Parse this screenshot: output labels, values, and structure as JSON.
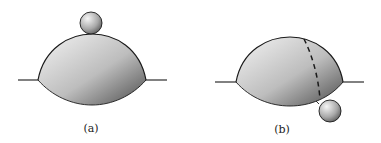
{
  "panels": [
    {
      "id": "a",
      "label": "(a)",
      "description": "Small sphere resting on top of a lens-shaped drop at an interface"
    },
    {
      "id": "b",
      "label": "(b)",
      "description": "Lens-shaped drop with dashed boundary; small sphere detached below the interface on the right"
    }
  ],
  "colors": {
    "stroke": "#1a1a1a",
    "gradient_light": "#f2f2f2",
    "gradient_dark": "#4a4a4a"
  }
}
